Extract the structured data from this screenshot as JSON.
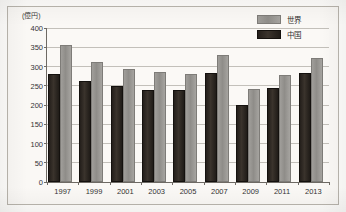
{
  "chart_data": {
    "type": "bar",
    "title": "",
    "subtitle": "",
    "unit_label": "(億円)",
    "xlabel": "",
    "ylabel": "",
    "categories": [
      "1997",
      "1999",
      "2001",
      "2003",
      "2005",
      "2007",
      "2009",
      "2011",
      "2013"
    ],
    "series": [
      {
        "name": "中国",
        "key": "china",
        "color": "#2a241f",
        "values": [
          276,
          256,
          243,
          235,
          235,
          277,
          196,
          238,
          278
        ]
      },
      {
        "name": "世界",
        "key": "world",
        "color": "#9a9894",
        "values": [
          350,
          307,
          288,
          280,
          275,
          324,
          236,
          273,
          316
        ]
      }
    ],
    "ylim": [
      0,
      400
    ],
    "ytick_values": [
      0,
      50,
      100,
      150,
      200,
      250,
      300,
      350,
      400
    ],
    "ytick_labels": [
      "0",
      "50",
      "100",
      "150",
      "200",
      "250",
      "300",
      "350",
      "400"
    ],
    "grid": true,
    "grid_axis": "y",
    "legend_position": "top-right",
    "legend_entries": [
      "世界",
      "中国"
    ]
  },
  "legend": {
    "world_label": "世界",
    "china_label": "中国"
  },
  "axes": {
    "unit": "(億円)"
  }
}
